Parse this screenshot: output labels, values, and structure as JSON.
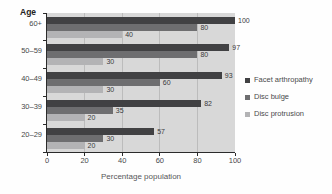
{
  "chart_data": {
    "type": "bar",
    "orientation": "horizontal",
    "title": "",
    "xlabel": "Percentage population",
    "ylabel": "Age",
    "xlim": [
      0,
      100
    ],
    "xticks": [
      0,
      20,
      40,
      60,
      80,
      100
    ],
    "categories": [
      "60+",
      "50–59",
      "40–49",
      "30–39",
      "20–29"
    ],
    "series": [
      {
        "name": "Facet arthropathy",
        "color": "#414143",
        "values": [
          100,
          97,
          93,
          82,
          57
        ]
      },
      {
        "name": "Disc bulge",
        "color": "#6e6e70",
        "values": [
          80,
          80,
          60,
          35,
          30
        ]
      },
      {
        "name": "Disc protrusion",
        "color": "#b3b3b5",
        "values": [
          40,
          30,
          30,
          20,
          20
        ]
      }
    ],
    "value_labels_shown": true,
    "legend_position": "right",
    "grid": "vertical",
    "plot_background": "#d8d8d8",
    "grid_color": "#bcbcbc",
    "axis_color": "#2b2b2b",
    "text_color": "#48484a"
  }
}
